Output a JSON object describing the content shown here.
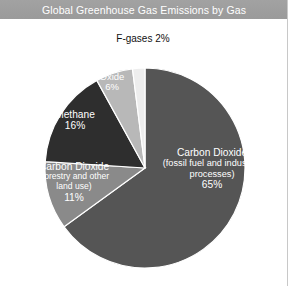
{
  "title": {
    "text": "Global Greenhouse Gas Emissions by Gas"
  },
  "labels": {
    "fgases": "F-gases 2%",
    "n2o_line1": "Nitrous",
    "n2o_line2": "Oxide",
    "n2o_value": "6%",
    "methane_name": "Methane",
    "methane_value": "16%",
    "co2_forestry_line1": "Carbon Dioxide",
    "co2_forestry_line2": "(forestry and other",
    "co2_forestry_line3": "land use)",
    "co2_forestry_value": "11%",
    "co2_fossil_line1": "Carbon Dioxide",
    "co2_fossil_line2": "(fossil fuel and industrial",
    "co2_fossil_line3": "processes)",
    "co2_fossil_value": "65%"
  },
  "colors": {
    "title_bar": "#9a9a9a",
    "title_text": "#ffffff",
    "background": "#ffffff",
    "co2_fossil": "#555555",
    "co2_forestry": "#8a8a8a",
    "methane": "#2e2e2e",
    "nitrous_oxide": "#b8b8b8",
    "fgases": "#ededed",
    "slice_outline": "#ffffff"
  },
  "chart_data": {
    "type": "pie",
    "title": "Global Greenhouse Gas Emissions by Gas",
    "categories": [
      "Carbon Dioxide (fossil fuel and industrial processes)",
      "Carbon Dioxide (forestry and other land use)",
      "Methane",
      "Nitrous Oxide",
      "F-gases"
    ],
    "values": [
      65,
      11,
      16,
      6,
      2
    ],
    "unit": "%",
    "colors": [
      "#555555",
      "#8a8a8a",
      "#2e2e2e",
      "#b8b8b8",
      "#ededed"
    ],
    "start_angle_deg": 0,
    "direction": "clockwise",
    "legend": "none",
    "labels_inside": true,
    "grid": false
  }
}
